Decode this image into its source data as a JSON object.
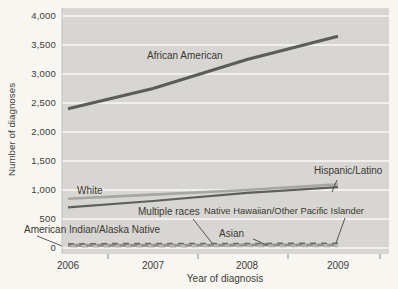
{
  "figure": {
    "y_axis_title": "Number of diagnoses",
    "x_axis_title": "Year of diagnosis",
    "plot_background": "#d7d6d2",
    "gridline_color": "#f1f0ec",
    "page_background": "#f7f6f1"
  },
  "chart_data": {
    "type": "line",
    "title": "",
    "xlabel": "Year of diagnosis",
    "ylabel": "Number of diagnoses",
    "x": [
      2006,
      2007,
      2008,
      2009
    ],
    "x_labels": [
      "2006",
      "2007",
      "2008",
      "2009"
    ],
    "ylim": [
      0,
      4000
    ],
    "ytick_step": 500,
    "ytick_labels": [
      "0",
      "500",
      "1,000",
      "1,500",
      "2,000",
      "2,500",
      "3,000",
      "3,500",
      "4,000"
    ],
    "grid": true,
    "legend_position": "inline-annotations",
    "series": [
      {
        "name": "African American",
        "values": [
          2400,
          2750,
          3250,
          3650
        ],
        "color": "#5d5c58",
        "width": 3.2,
        "dash": ""
      },
      {
        "name": "White",
        "values": [
          850,
          920,
          1000,
          1100
        ],
        "color": "#a7a6a2",
        "width": 2.6,
        "dash": ""
      },
      {
        "name": "Hispanic/Latino",
        "values": [
          700,
          810,
          950,
          1050
        ],
        "color": "#605f5b",
        "width": 2.2,
        "dash": ""
      },
      {
        "name": "Multiple races",
        "values": [
          70,
          75,
          75,
          80
        ],
        "color": "#6b6a66",
        "width": 1.9,
        "dash": "6 5",
        "dashoffset": 0
      },
      {
        "name": "Native Hawaiian/Other Pacific Islander",
        "values": [
          25,
          25,
          30,
          30
        ],
        "color": "#b3b2ae",
        "width": 1.9,
        "dash": "6 5",
        "dashoffset": 8
      },
      {
        "name": "American Indian/Alaska Native",
        "values": [
          55,
          55,
          60,
          60
        ],
        "color": "#a09c97",
        "width": 1.9,
        "dash": "6 5",
        "dashoffset": 5.5
      },
      {
        "name": "Asian",
        "values": [
          40,
          40,
          45,
          45
        ],
        "color": "#8a8984",
        "width": 1.9,
        "dash": "6 5",
        "dashoffset": 3
      }
    ]
  }
}
